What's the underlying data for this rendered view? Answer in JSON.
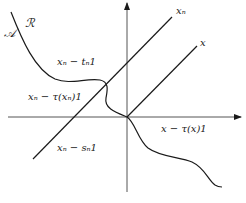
{
  "diagram": {
    "axes": {
      "horizontal": {
        "arrow": "right"
      },
      "vertical": {
        "arrow": "up"
      }
    },
    "lines": {
      "xn_line_label": "xₙ",
      "x_line_label": "x"
    },
    "regions": {
      "set_A": "𝒜",
      "set_R": "ℛ"
    },
    "points": {
      "xn_minus_tn": "xₙ − tₙ1",
      "xn_minus_tau_xn": "xₙ − τ(xₙ)1",
      "xn_minus_sn": "xₙ − sₙ1",
      "x_minus_tau_x": "x − τ(x)1"
    },
    "colors": {
      "stroke": "#1a1a1a",
      "axis": "#555555",
      "background": "#ffffff"
    }
  }
}
